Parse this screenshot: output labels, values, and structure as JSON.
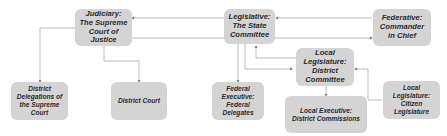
{
  "diagram": {
    "nodes": [
      {
        "id": "judiciary",
        "label": "Judiciary:\nThe Supreme\nCourt of\nJustice"
      },
      {
        "id": "legislative",
        "label": "Legislative:\nThe State\nCommittee"
      },
      {
        "id": "federative",
        "label": "Federative:\nCommander\nin Chief"
      },
      {
        "id": "local_legislature_district",
        "label": "Local\nLegislature:\nDistrict\nCommittee"
      },
      {
        "id": "district_delegations",
        "label": "District\nDelegations of\nthe Supreme\nCourt"
      },
      {
        "id": "district_court",
        "label": "District Court"
      },
      {
        "id": "federal_executive",
        "label": "Federal\nExecutive:\nFederal\nDelegates"
      },
      {
        "id": "local_executive",
        "label": "Local Executive:\nDistrict Commissions"
      },
      {
        "id": "local_legislature_citizen",
        "label": "Local\nLegislature:\nCitizen\nLegislature"
      }
    ],
    "edges": [
      {
        "from": "legislative",
        "to": "judiciary"
      },
      {
        "from": "judiciary",
        "to": "federative"
      },
      {
        "from": "federative",
        "to": "legislative"
      },
      {
        "from": "judiciary",
        "to": "district_delegations"
      },
      {
        "from": "judiciary",
        "to": "district_court"
      },
      {
        "from": "legislative",
        "to": "federal_executive"
      },
      {
        "from": "legislative",
        "to": "local_legislature_district"
      },
      {
        "from": "local_legislature_district",
        "to": "legislative"
      },
      {
        "from": "local_legislature_district",
        "to": "local_executive"
      },
      {
        "from": "local_legislature_citizen",
        "to": "local_legislature_district"
      }
    ],
    "colors": {
      "node_fill": "#d4d4d4",
      "edge": "#9a9a9a",
      "text": "#2a2a2a"
    }
  }
}
